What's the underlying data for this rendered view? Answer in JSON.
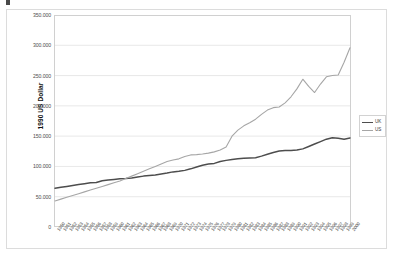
{
  "header": {
    "crumb_text": "· · ·   · · ·   · ·"
  },
  "chart_data": {
    "type": "line",
    "title": "",
    "xlabel": "",
    "ylabel": "1990 US Dollar",
    "ylim": [
      0,
      350000
    ],
    "ytick_labels": [
      "350.000",
      "300.000",
      "250.000",
      "200.000",
      "150.000",
      "100.000",
      "50.000",
      "0"
    ],
    "ytick_values": [
      350000,
      300000,
      250000,
      200000,
      150000,
      100000,
      50000,
      0
    ],
    "grid": true,
    "legend_position": "right",
    "categories": [
      "1950",
      "1951",
      "1952",
      "1953",
      "1954",
      "1955",
      "1956",
      "1957",
      "1958",
      "1959",
      "1960",
      "1961",
      "1962",
      "1963",
      "1964",
      "1965",
      "1966",
      "1967",
      "1968",
      "1969",
      "1970",
      "1971",
      "1972",
      "1973",
      "1974",
      "1975",
      "1976",
      "1977",
      "1978",
      "1979",
      "1980",
      "1981",
      "1982",
      "1983",
      "1984",
      "1985",
      "1986",
      "1987",
      "1988",
      "1989",
      "1990",
      "1991",
      "1992",
      "1993",
      "1994",
      "1995",
      "1996",
      "1997",
      "1998",
      "1999",
      "2000"
    ],
    "xtick_labels": [
      "1950",
      "1951",
      "1952",
      "1953",
      "1954",
      "1955",
      "1956",
      "1957",
      "1958",
      "1959",
      "1960",
      "1961",
      "1962",
      "1963",
      "1964",
      "1965",
      "1966",
      "1967",
      "1968",
      "1969",
      "1970",
      "1971",
      "1972",
      "1973",
      "1974",
      "1975",
      "1976",
      "1977",
      "1978",
      "1979",
      "1980",
      "1981",
      "1982",
      "1983",
      "1984",
      "1985",
      "1986",
      "1987",
      "1988",
      "1989",
      "1990",
      "1991",
      "1992",
      "1993",
      "1994",
      "1995",
      "1996",
      "1997",
      "1998",
      "1999",
      "2000"
    ],
    "series": [
      {
        "name": "UK",
        "color": "#4d4d4d",
        "values": [
          64000,
          65500,
          67000,
          68500,
          70000,
          71500,
          73000,
          73500,
          76500,
          77500,
          78500,
          79500,
          80000,
          81000,
          82500,
          84000,
          85000,
          86000,
          87500,
          89000,
          91000,
          92000,
          93500,
          96000,
          99000,
          102000,
          104000,
          105000,
          108000,
          110000,
          111500,
          112500,
          113500,
          114000,
          114500,
          117000,
          120000,
          123000,
          125500,
          126500,
          126500,
          127000,
          129000,
          133000,
          137000,
          141000,
          145000,
          147500,
          146500,
          145000,
          147000
        ]
      },
      {
        "name": "US",
        "color": "#a6a6a6",
        "values": [
          43000,
          46000,
          49000,
          52000,
          55000,
          58000,
          61000,
          64000,
          67000,
          70000,
          73000,
          76000,
          80000,
          84000,
          88000,
          92000,
          96000,
          100000,
          104000,
          108000,
          110500,
          112500,
          116500,
          119000,
          119500,
          120500,
          122000,
          124000,
          127000,
          132000,
          150000,
          160000,
          167000,
          172000,
          178000,
          186000,
          193000,
          197000,
          198000,
          205000,
          215000,
          228000,
          244000,
          232000,
          222000,
          236000,
          248000,
          250000,
          251000,
          272000,
          296000
        ]
      }
    ]
  },
  "legend": {
    "items": [
      {
        "label": "UK",
        "color": "#4d4d4d"
      },
      {
        "label": "US",
        "color": "#a6a6a6"
      }
    ]
  }
}
